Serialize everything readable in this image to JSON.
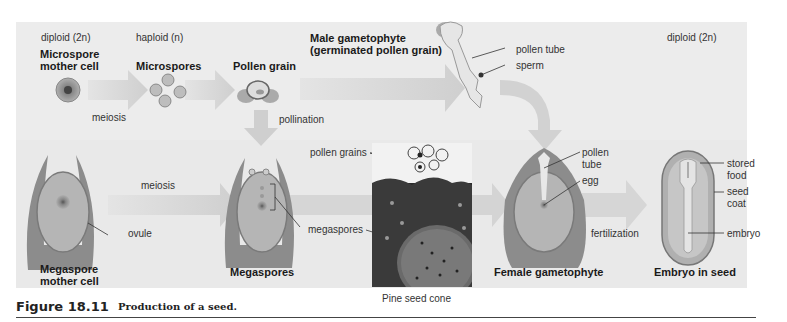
{
  "figure": {
    "number": "Figure 18.11",
    "title": "Production of a seed."
  },
  "ploidy_labels": {
    "left": "diploid (2n)",
    "middle": "haploid (n)",
    "right": "diploid (2n)"
  },
  "top_row": {
    "stages": [
      {
        "label": "Microspore\nmother cell"
      },
      {
        "label": "Microspores"
      },
      {
        "label": "Pollen grain"
      },
      {
        "label": "Male gametophyte\n(germinated pollen grain)"
      }
    ],
    "process": "meiosis",
    "pollination": "pollination",
    "callouts": [
      "pollen tube",
      "sperm"
    ]
  },
  "bottom_row": {
    "stages": [
      {
        "label": "Megaspore\nmother cell",
        "callouts": [
          "ovule"
        ]
      },
      {
        "label": "Megaspores",
        "callouts": [
          "megaspores"
        ]
      },
      {
        "label": "Female gametophyte",
        "callouts": [
          "pollen\ntube",
          "egg"
        ]
      },
      {
        "label": "Embryo in seed",
        "callouts": [
          "stored\nfood",
          "seed\ncoat",
          "embryo"
        ]
      }
    ],
    "process_meiosis": "meiosis",
    "process_fertilization": "fertilization"
  },
  "micrograph": {
    "caption": "Pine seed cone",
    "callouts": [
      "pollen grains",
      "megaspores"
    ]
  },
  "colors": {
    "panel": "#ececec",
    "arrow": "#d2d2d2",
    "cell_fill": "#b8b8b8",
    "tissue": "#8f8f8f",
    "text": "#222222"
  }
}
